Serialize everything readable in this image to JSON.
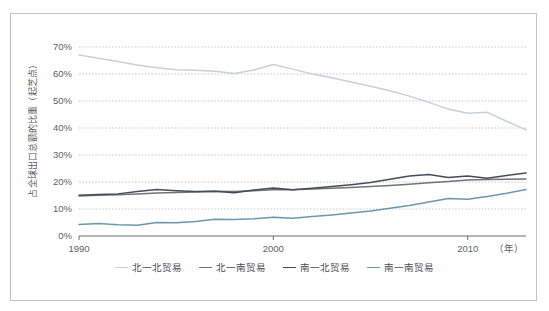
{
  "chart_data": {
    "type": "line",
    "title": "",
    "xlabel": "（年）",
    "ylabel": "占全球出口总额的比重（起芝点）",
    "xlim": [
      1990,
      2013
    ],
    "ylim": [
      0,
      70
    ],
    "grid": true,
    "legend_position": "bottom",
    "x": [
      1990,
      1991,
      1992,
      1993,
      1994,
      1995,
      1996,
      1997,
      1998,
      1999,
      2000,
      2001,
      2002,
      2003,
      2004,
      2005,
      2006,
      2007,
      2008,
      2009,
      2010,
      2011,
      2012,
      2013
    ],
    "y_ticks": [
      "0%",
      "10%",
      "20%",
      "30%",
      "40%",
      "50%",
      "60%",
      "70%"
    ],
    "y_tick_values": [
      0,
      10,
      20,
      30,
      40,
      50,
      60,
      70
    ],
    "x_ticks": [
      "1990",
      "2000",
      "2010"
    ],
    "x_tick_values": [
      1990,
      2000,
      2010
    ],
    "series": [
      {
        "name": "北一北贸易",
        "color": "#c8cfdd",
        "values": [
          67.0,
          65.8,
          64.6,
          63.3,
          62.3,
          61.6,
          61.4,
          61.0,
          60.2,
          61.5,
          63.5,
          61.8,
          60.0,
          58.6,
          57.0,
          55.5,
          53.8,
          51.8,
          49.5,
          47.0,
          45.5,
          45.8,
          42.5,
          39.3
        ]
      },
      {
        "name": "北一南贸易",
        "color": "#6f7479",
        "values": [
          14.8,
          15.1,
          15.3,
          15.6,
          15.9,
          16.1,
          16.3,
          16.6,
          16.5,
          16.8,
          17.1,
          17.1,
          17.4,
          17.7,
          18.0,
          18.3,
          18.7,
          19.2,
          19.7,
          20.2,
          20.7,
          20.9,
          21.0,
          21.1
        ]
      },
      {
        "name": "南一北贸易",
        "color": "#444c5c",
        "values": [
          15.1,
          15.4,
          15.6,
          16.5,
          17.2,
          16.8,
          16.5,
          16.6,
          16.0,
          17.0,
          17.8,
          17.1,
          17.7,
          18.3,
          19.0,
          19.8,
          21.0,
          22.2,
          22.8,
          21.7,
          22.2,
          21.4,
          22.4,
          23.3
        ]
      },
      {
        "name": "南一南贸易",
        "color": "#6e97ad",
        "values": [
          4.3,
          4.6,
          4.2,
          4.0,
          5.0,
          4.9,
          5.4,
          6.2,
          6.1,
          6.4,
          6.9,
          6.6,
          7.2,
          7.8,
          8.5,
          9.3,
          10.3,
          11.3,
          12.6,
          13.9,
          13.6,
          14.6,
          15.8,
          17.2
        ]
      }
    ]
  },
  "legend": {
    "items": [
      {
        "label": "北一北贸易",
        "color": "#c8cfdd"
      },
      {
        "label": "北一南贸易",
        "color": "#6f7479"
      },
      {
        "label": "南一北贸易",
        "color": "#444c5c"
      },
      {
        "label": "南一南贸易",
        "color": "#6e97ad"
      }
    ]
  },
  "axes": {
    "y_axis_label": "占全球出口总额的比重（起芝点）",
    "x_axis_unit": "（年）"
  }
}
